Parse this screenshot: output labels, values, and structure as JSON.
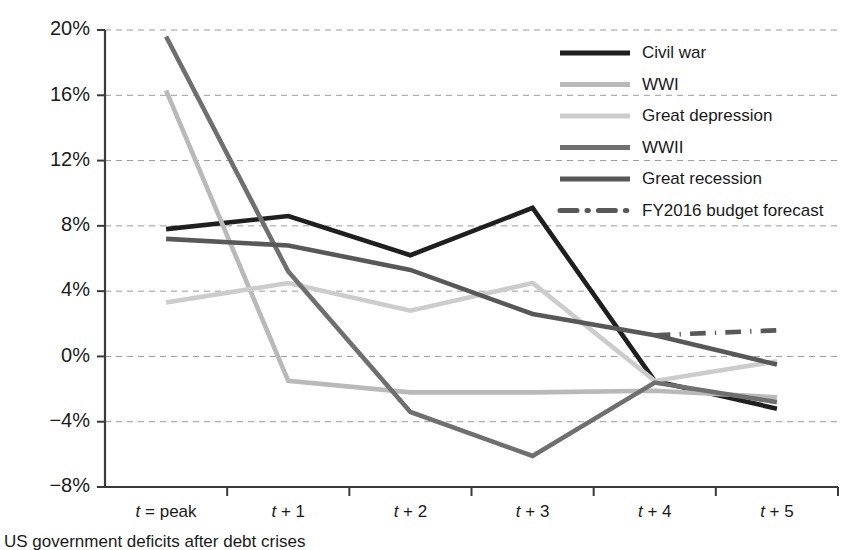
{
  "caption": "US government deficits after debt crises",
  "colors": {
    "civil_war": "#1f1f1f",
    "wwi": "#b9b9b9",
    "great_depression": "#cccccc",
    "wwii": "#6f6f6f",
    "great_recession": "#585858",
    "fy2016_forecast": "#585858",
    "gridline": "#9a9a9a",
    "axis": "#3a3a3a",
    "text": "#1a1a1a",
    "background": "#ffffff"
  },
  "legend": {
    "position": "top-right",
    "items": [
      {
        "label": "Civil war",
        "color": "#1f1f1f",
        "style": "solid",
        "width": 5
      },
      {
        "label": "WWI",
        "color": "#b9b9b9",
        "style": "solid",
        "width": 5
      },
      {
        "label": "Great depression",
        "color": "#cccccc",
        "style": "solid",
        "width": 5
      },
      {
        "label": "WWII",
        "color": "#6f6f6f",
        "style": "solid",
        "width": 5
      },
      {
        "label": "Great recession",
        "color": "#585858",
        "style": "solid",
        "width": 5
      },
      {
        "label": "FY2016 budget forecast",
        "color": "#585858",
        "style": "dash-dot",
        "width": 5
      }
    ]
  },
  "chart_data": {
    "type": "line",
    "title": "",
    "subtitle": "",
    "xlabel": "",
    "ylabel": "",
    "categories": [
      "t = peak",
      "t + 1",
      "t + 2",
      "t + 3",
      "t + 4",
      "t + 5"
    ],
    "x_tick_labels": [
      "t = peak",
      "t + 1",
      "t + 2",
      "t + 3",
      "t + 4",
      "t + 5"
    ],
    "y_tick_labels": [
      "20%",
      "16%",
      "12%",
      "8%",
      "4%",
      "0%",
      "-4%",
      "-8%"
    ],
    "y_tick_values": [
      20,
      16,
      12,
      8,
      4,
      0,
      -4,
      -8
    ],
    "ylim": [
      -8,
      20
    ],
    "xlim": [
      0,
      5
    ],
    "grid": true,
    "grid_axis": "y",
    "units": "percent of GDP",
    "series": [
      {
        "name": "Civil war",
        "color": "#1f1f1f",
        "style": "solid",
        "values": [
          7.8,
          8.6,
          6.2,
          9.1,
          -1.5,
          -3.2
        ]
      },
      {
        "name": "WWI",
        "color": "#b9b9b9",
        "style": "solid",
        "values": [
          16.3,
          -1.5,
          -2.2,
          -2.2,
          -2.1,
          -2.5
        ]
      },
      {
        "name": "Great depression",
        "color": "#cccccc",
        "style": "solid",
        "values": [
          3.3,
          4.5,
          2.8,
          4.5,
          -1.5,
          -0.3
        ]
      },
      {
        "name": "WWII",
        "color": "#6f6f6f",
        "style": "solid",
        "values": [
          19.6,
          5.2,
          -3.4,
          -6.1,
          -1.6,
          -2.8
        ]
      },
      {
        "name": "Great recession",
        "color": "#585858",
        "style": "solid",
        "values": [
          7.2,
          6.8,
          5.3,
          2.6,
          1.3,
          -0.5
        ]
      },
      {
        "name": "FY2016 budget forecast",
        "color": "#585858",
        "style": "dash-dot",
        "values": [
          null,
          null,
          null,
          null,
          1.3,
          1.6
        ]
      }
    ]
  }
}
